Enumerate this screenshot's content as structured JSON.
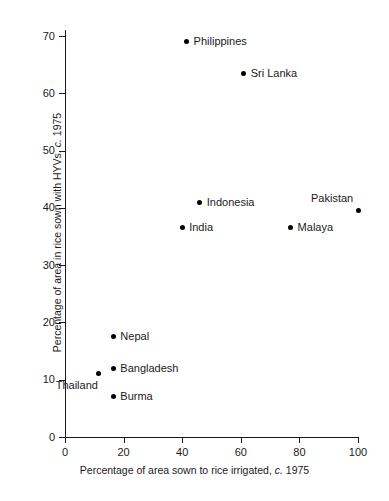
{
  "chart_data": {
    "type": "scatter",
    "title": "",
    "xlabel": "Percentage of area sown to rice irrigated, c. 1975",
    "ylabel": "Percentage of area in rice sown with HYVs, c. 1975",
    "xlabel_parts": {
      "before": "Percentage of area sown to rice irrigated, ",
      "italic": "c.",
      "after": " 1975"
    },
    "ylabel_parts": {
      "before": "Percentage of area in rice sown with HYVs, ",
      "italic": "c.",
      "after": " 1975"
    },
    "xlim": [
      0,
      100
    ],
    "ylim": [
      0,
      70
    ],
    "xticks": [
      0,
      20,
      40,
      60,
      80,
      100
    ],
    "yticks": [
      0,
      10,
      20,
      30,
      40,
      50,
      60,
      70
    ],
    "xticklabels": [
      "0",
      "20",
      "40",
      "60",
      "80",
      "100"
    ],
    "yticklabels": [
      "0",
      "10",
      "20",
      "30",
      "40",
      "50",
      "60",
      "70"
    ],
    "grid": false,
    "legend": false,
    "marker_color": "#000000",
    "axis_color": "#1a1a1a",
    "points": [
      {
        "label": "Philippines",
        "x": 41.5,
        "y": 69.0,
        "label_pos": "right"
      },
      {
        "label": "Sri Lanka",
        "x": 61.0,
        "y": 63.5,
        "label_pos": "right"
      },
      {
        "label": "Indonesia",
        "x": 46.0,
        "y": 41.0,
        "label_pos": "right"
      },
      {
        "label": "Pakistan",
        "x": 100.0,
        "y": 39.5,
        "label_pos": "above-left"
      },
      {
        "label": "India",
        "x": 40.0,
        "y": 36.5,
        "label_pos": "right"
      },
      {
        "label": "Malaya",
        "x": 77.0,
        "y": 36.5,
        "label_pos": "right"
      },
      {
        "label": "Nepal",
        "x": 16.5,
        "y": 17.5,
        "label_pos": "right"
      },
      {
        "label": "Bangladesh",
        "x": 16.5,
        "y": 12.0,
        "label_pos": "right"
      },
      {
        "label": "Thailand",
        "x": 11.5,
        "y": 11.0,
        "label_pos": "below-left"
      },
      {
        "label": "Burma",
        "x": 16.5,
        "y": 7.0,
        "label_pos": "right"
      }
    ]
  }
}
